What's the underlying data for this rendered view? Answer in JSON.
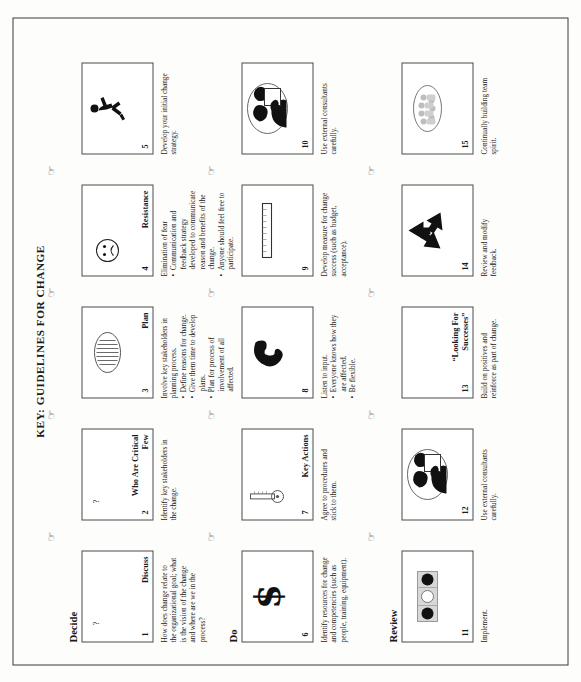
{
  "document": {
    "title": "KEY: GUIDELINES FOR CHANGE",
    "orientation": "landscape-rotated-90-ccw"
  },
  "rows": [
    {
      "label": "Decide",
      "cells": [
        {
          "number": "1",
          "caption": "Discuss",
          "question_mark": "?",
          "icon": "question-mark-icon",
          "desc_intro": "How does change relate to the organizational goal; what is the vision of the change and where are we in the process?",
          "bullets": []
        },
        {
          "number": "2",
          "caption": "Who Are Critical Few",
          "question_mark": "?",
          "icon": "question-mark-icon",
          "desc_intro": "Identify key stakeholders in the change.",
          "bullets": []
        },
        {
          "number": "3",
          "caption": "Plan",
          "question_mark": "",
          "icon": "plan-scroll-oval-icon",
          "desc_intro": "Involve key stakeholders in planning process.",
          "bullets": [
            "Define reasons for change.",
            "Give them time to develop plans.",
            "Plan for process of involvement of all affected."
          ]
        },
        {
          "number": "4",
          "caption": "Resistance",
          "question_mark": "",
          "icon": "sad-face-icon",
          "desc_intro": "Elimination of fear",
          "bullets": [
            "Communication and feedback strategy developed to communicate reason and benefits of the change.",
            "Anyone should feel free to participate."
          ]
        },
        {
          "number": "5",
          "caption": "",
          "question_mark": "",
          "icon": "running-person-icon",
          "desc_intro": "Develop your initial change strategy.",
          "bullets": []
        }
      ]
    },
    {
      "label": "Do",
      "cells": [
        {
          "number": "6",
          "caption": "",
          "question_mark": "",
          "icon": "dollar-sign-icon",
          "desc_intro": "Identify resources for change and competencies (such as people, training, equipment).",
          "bullets": []
        },
        {
          "number": "7",
          "caption": "Key Actions",
          "question_mark": "",
          "icon": "key-icon",
          "desc_intro": "Agree to procedures and stick to them.",
          "bullets": []
        },
        {
          "number": "8",
          "caption": "",
          "question_mark": "",
          "icon": "ear-listening-icon",
          "desc_intro": "Listen to input.",
          "bullets": [
            "Everyone knows how they are affected.",
            "Be flexible."
          ]
        },
        {
          "number": "9",
          "caption": "",
          "question_mark": "",
          "icon": "ruler-measure-icon",
          "desc_intro": "Develop measure for change success (such as budget, acceptance).",
          "bullets": []
        },
        {
          "number": "10",
          "caption": "",
          "question_mark": "",
          "icon": "consultants-handshake-icon",
          "desc_intro": "Use external consultants carefully.",
          "bullets": []
        }
      ]
    },
    {
      "label": "Review",
      "cells": [
        {
          "number": "11",
          "caption": "",
          "question_mark": "",
          "icon": "traffic-light-icon",
          "desc_intro": "Implement.",
          "bullets": []
        },
        {
          "number": "12",
          "caption": "",
          "question_mark": "",
          "icon": "consultants-handshake-icon",
          "desc_intro": "Use external consultants carefully.",
          "bullets": []
        },
        {
          "number": "13",
          "caption": "“Looking For Successes”",
          "question_mark": "",
          "icon": "none",
          "desc_intro": "Build on positives and reinforce as part of change.",
          "bullets": []
        },
        {
          "number": "14",
          "caption": "",
          "question_mark": "",
          "icon": "recycle-arrows-icon",
          "desc_intro": "Review and modify feedback.",
          "bullets": []
        },
        {
          "number": "15",
          "caption": "",
          "question_mark": "",
          "icon": "team-oval-icon",
          "desc_intro": "Continually building team spirit.",
          "bullets": []
        }
      ]
    }
  ],
  "connector": {
    "glyph": "☞",
    "name": "pointing-hand-icon",
    "count_per_row": 4
  },
  "colors": {
    "page_background": "#fdfdfb",
    "frame_border": "#3a3a3a",
    "box_border": "#4a4a4a",
    "ink": "#1a1a1a",
    "art_fill": "#111111"
  }
}
